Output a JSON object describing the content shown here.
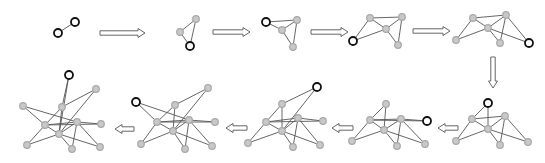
{
  "diagram": {
    "title": "",
    "colors": {
      "edge": "#555555",
      "existing_node": "#c8c8c8",
      "new_node_stroke": "#111111",
      "arrow_stroke": "#666666"
    },
    "graphs": [
      {
        "step": 1,
        "nodes": [
          {
            "x": 58,
            "y": 33,
            "type": "new"
          },
          {
            "x": 75,
            "y": 22,
            "type": "new"
          }
        ],
        "edges": [
          [
            0,
            1
          ]
        ]
      },
      {
        "step": 2,
        "nodes": [
          {
            "x": 180,
            "y": 32,
            "type": "old"
          },
          {
            "x": 196,
            "y": 19,
            "type": "old"
          },
          {
            "x": 190,
            "y": 46,
            "type": "new"
          }
        ],
        "edges": [
          [
            0,
            1
          ],
          [
            0,
            2
          ],
          [
            1,
            2
          ]
        ]
      },
      {
        "step": 3,
        "nodes": [
          {
            "x": 297,
            "y": 20,
            "type": "old"
          },
          {
            "x": 282,
            "y": 30,
            "type": "old"
          },
          {
            "x": 293,
            "y": 47,
            "type": "old"
          },
          {
            "x": 266,
            "y": 22,
            "type": "new"
          }
        ],
        "edges": [
          [
            0,
            1
          ],
          [
            0,
            2
          ],
          [
            1,
            2
          ],
          [
            3,
            0
          ],
          [
            3,
            1
          ]
        ]
      },
      {
        "step": 4,
        "nodes": [
          {
            "x": 370,
            "y": 18,
            "type": "old"
          },
          {
            "x": 402,
            "y": 17,
            "type": "old"
          },
          {
            "x": 386,
            "y": 29,
            "type": "old"
          },
          {
            "x": 398,
            "y": 45,
            "type": "old"
          },
          {
            "x": 353,
            "y": 41,
            "type": "new"
          }
        ],
        "edges": [
          [
            0,
            1
          ],
          [
            0,
            2
          ],
          [
            1,
            2
          ],
          [
            1,
            3
          ],
          [
            2,
            3
          ],
          [
            4,
            0
          ],
          [
            4,
            2
          ]
        ]
      },
      {
        "step": 5,
        "nodes": [
          {
            "x": 473,
            "y": 18,
            "type": "old"
          },
          {
            "x": 506,
            "y": 15,
            "type": "old"
          },
          {
            "x": 488,
            "y": 28,
            "type": "old"
          },
          {
            "x": 500,
            "y": 43,
            "type": "old"
          },
          {
            "x": 456,
            "y": 40,
            "type": "old"
          },
          {
            "x": 529,
            "y": 43,
            "type": "new"
          }
        ],
        "edges": [
          [
            0,
            1
          ],
          [
            0,
            2
          ],
          [
            1,
            2
          ],
          [
            1,
            3
          ],
          [
            2,
            3
          ],
          [
            4,
            0
          ],
          [
            4,
            2
          ],
          [
            5,
            1
          ],
          [
            5,
            2
          ]
        ]
      },
      {
        "step": 6,
        "nodes": [
          {
            "x": 472,
            "y": 119,
            "type": "old"
          },
          {
            "x": 505,
            "y": 116,
            "type": "old"
          },
          {
            "x": 488,
            "y": 129,
            "type": "old"
          },
          {
            "x": 500,
            "y": 145,
            "type": "old"
          },
          {
            "x": 456,
            "y": 141,
            "type": "old"
          },
          {
            "x": 528,
            "y": 142,
            "type": "old"
          },
          {
            "x": 488,
            "y": 103,
            "type": "new"
          }
        ],
        "edges": [
          [
            0,
            1
          ],
          [
            0,
            2
          ],
          [
            1,
            2
          ],
          [
            1,
            3
          ],
          [
            2,
            3
          ],
          [
            4,
            0
          ],
          [
            4,
            2
          ],
          [
            5,
            1
          ],
          [
            5,
            2
          ],
          [
            6,
            0
          ],
          [
            6,
            2
          ]
        ]
      },
      {
        "step": 7,
        "nodes": [
          {
            "x": 370,
            "y": 120,
            "type": "old"
          },
          {
            "x": 401,
            "y": 119,
            "type": "old"
          },
          {
            "x": 384,
            "y": 130,
            "type": "old"
          },
          {
            "x": 397,
            "y": 146,
            "type": "old"
          },
          {
            "x": 352,
            "y": 141,
            "type": "old"
          },
          {
            "x": 425,
            "y": 144,
            "type": "old"
          },
          {
            "x": 386,
            "y": 104,
            "type": "old"
          },
          {
            "x": 427,
            "y": 121,
            "type": "new"
          }
        ],
        "edges": [
          [
            0,
            1
          ],
          [
            0,
            2
          ],
          [
            1,
            2
          ],
          [
            1,
            3
          ],
          [
            2,
            3
          ],
          [
            4,
            0
          ],
          [
            4,
            2
          ],
          [
            5,
            1
          ],
          [
            5,
            2
          ],
          [
            6,
            0
          ],
          [
            6,
            2
          ],
          [
            7,
            0
          ],
          [
            7,
            1
          ]
        ]
      },
      {
        "step": 8,
        "nodes": [
          {
            "x": 266,
            "y": 122,
            "type": "old"
          },
          {
            "x": 298,
            "y": 118,
            "type": "old"
          },
          {
            "x": 282,
            "y": 131,
            "type": "old"
          },
          {
            "x": 293,
            "y": 147,
            "type": "old"
          },
          {
            "x": 248,
            "y": 143,
            "type": "old"
          },
          {
            "x": 320,
            "y": 145,
            "type": "old"
          },
          {
            "x": 282,
            "y": 104,
            "type": "old"
          },
          {
            "x": 323,
            "y": 121,
            "type": "old"
          },
          {
            "x": 317,
            "y": 87,
            "type": "new"
          }
        ],
        "edges": [
          [
            0,
            1
          ],
          [
            0,
            2
          ],
          [
            1,
            2
          ],
          [
            1,
            3
          ],
          [
            2,
            3
          ],
          [
            4,
            0
          ],
          [
            4,
            2
          ],
          [
            5,
            1
          ],
          [
            5,
            2
          ],
          [
            6,
            0
          ],
          [
            6,
            2
          ],
          [
            7,
            0
          ],
          [
            7,
            1
          ],
          [
            8,
            6
          ],
          [
            8,
            2
          ]
        ]
      },
      {
        "step": 9,
        "nodes": [
          {
            "x": 157,
            "y": 122,
            "type": "old"
          },
          {
            "x": 189,
            "y": 120,
            "type": "old"
          },
          {
            "x": 173,
            "y": 131,
            "type": "old"
          },
          {
            "x": 185,
            "y": 149,
            "type": "old"
          },
          {
            "x": 141,
            "y": 144,
            "type": "old"
          },
          {
            "x": 212,
            "y": 146,
            "type": "old"
          },
          {
            "x": 175,
            "y": 105,
            "type": "old"
          },
          {
            "x": 215,
            "y": 122,
            "type": "old"
          },
          {
            "x": 208,
            "y": 88,
            "type": "old"
          },
          {
            "x": 136,
            "y": 102,
            "type": "new"
          }
        ],
        "edges": [
          [
            0,
            1
          ],
          [
            0,
            2
          ],
          [
            1,
            2
          ],
          [
            1,
            3
          ],
          [
            2,
            3
          ],
          [
            4,
            0
          ],
          [
            4,
            2
          ],
          [
            5,
            1
          ],
          [
            5,
            2
          ],
          [
            6,
            0
          ],
          [
            6,
            2
          ],
          [
            7,
            0
          ],
          [
            7,
            1
          ],
          [
            8,
            6
          ],
          [
            8,
            2
          ],
          [
            9,
            0
          ],
          [
            9,
            1
          ]
        ]
      },
      {
        "step": 10,
        "nodes": [
          {
            "x": 45,
            "y": 125,
            "type": "old"
          },
          {
            "x": 77,
            "y": 122,
            "type": "old"
          },
          {
            "x": 59,
            "y": 134,
            "type": "old"
          },
          {
            "x": 72,
            "y": 149,
            "type": "old"
          },
          {
            "x": 27,
            "y": 145,
            "type": "old"
          },
          {
            "x": 100,
            "y": 147,
            "type": "old"
          },
          {
            "x": 62,
            "y": 107,
            "type": "old"
          },
          {
            "x": 101,
            "y": 124,
            "type": "old"
          },
          {
            "x": 96,
            "y": 89,
            "type": "old"
          },
          {
            "x": 23,
            "y": 106,
            "type": "old"
          },
          {
            "x": 69,
            "y": 75,
            "type": "new"
          }
        ],
        "edges": [
          [
            0,
            1
          ],
          [
            0,
            2
          ],
          [
            1,
            2
          ],
          [
            1,
            3
          ],
          [
            2,
            3
          ],
          [
            4,
            0
          ],
          [
            4,
            2
          ],
          [
            5,
            1
          ],
          [
            5,
            2
          ],
          [
            6,
            0
          ],
          [
            6,
            2
          ],
          [
            7,
            0
          ],
          [
            7,
            1
          ],
          [
            8,
            6
          ],
          [
            8,
            2
          ],
          [
            9,
            0
          ],
          [
            9,
            1
          ],
          [
            10,
            6
          ],
          [
            10,
            2
          ]
        ]
      }
    ],
    "arrows": [
      {
        "direction": "right",
        "x1": 100,
        "y1": 33,
        "x2": 145,
        "y2": 33
      },
      {
        "direction": "right",
        "x1": 213,
        "y1": 32,
        "x2": 250,
        "y2": 32
      },
      {
        "direction": "right",
        "x1": 311,
        "y1": 32,
        "x2": 348,
        "y2": 32
      },
      {
        "direction": "right",
        "x1": 413,
        "y1": 31,
        "x2": 450,
        "y2": 31
      },
      {
        "direction": "down",
        "x1": 493,
        "y1": 57,
        "x2": 493,
        "y2": 88
      },
      {
        "direction": "left",
        "x1": 458,
        "y1": 128,
        "x2": 438,
        "y2": 128
      },
      {
        "direction": "left",
        "x1": 353,
        "y1": 128,
        "x2": 332,
        "y2": 128
      },
      {
        "direction": "left",
        "x1": 247,
        "y1": 128,
        "x2": 226,
        "y2": 128
      },
      {
        "direction": "left",
        "x1": 134,
        "y1": 129,
        "x2": 115,
        "y2": 129
      }
    ]
  }
}
